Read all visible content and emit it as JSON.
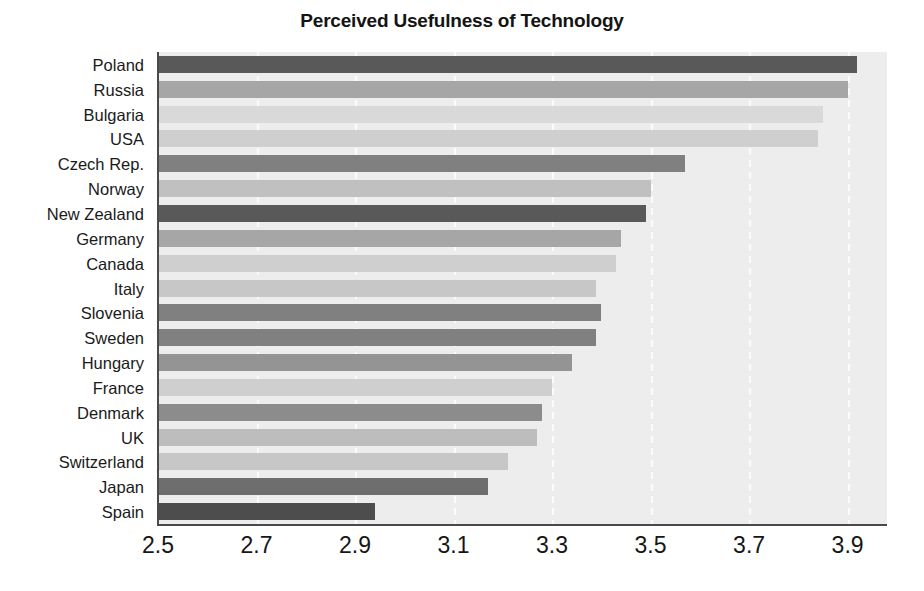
{
  "chart_data": {
    "type": "bar",
    "orientation": "horizontal",
    "title": "Perceived Usefulness of Technology",
    "xlabel": "",
    "ylabel": "",
    "xlim": [
      2.5,
      3.98
    ],
    "xticks": [
      "2.5",
      "2.7",
      "2.9",
      "3.1",
      "3.3",
      "3.5",
      "3.7",
      "3.9"
    ],
    "xtick_values": [
      2.5,
      2.7,
      2.9,
      3.1,
      3.3,
      3.5,
      3.7,
      3.9
    ],
    "grid": "vertical-dashed-white",
    "legend": "none",
    "plot_background": "#ededed",
    "categories": [
      "Poland",
      "Russia",
      "Bulgaria",
      "USA",
      "Czech Rep.",
      "Norway",
      "New Zealand",
      "Germany",
      "Canada",
      "Italy",
      "Slovenia",
      "Sweden",
      "Hungary",
      "France",
      "Denmark",
      "UK",
      "Switzerland",
      "Japan",
      "Spain"
    ],
    "values": [
      3.92,
      3.9,
      3.85,
      3.84,
      3.57,
      3.5,
      3.49,
      3.44,
      3.43,
      3.39,
      3.4,
      3.39,
      3.34,
      3.3,
      3.28,
      3.27,
      3.21,
      3.17,
      2.94
    ],
    "bar_colors": [
      "#595959",
      "#a6a6a6",
      "#d9d9d9",
      "#cfcfcf",
      "#808080",
      "#c0c0c0",
      "#595959",
      "#a6a6a6",
      "#cfcfcf",
      "#c7c7c7",
      "#808080",
      "#808080",
      "#949494",
      "#cfcfcf",
      "#8c8c8c",
      "#bdbdbd",
      "#c7c7c7",
      "#6e6e6e",
      "#4d4d4d"
    ]
  }
}
